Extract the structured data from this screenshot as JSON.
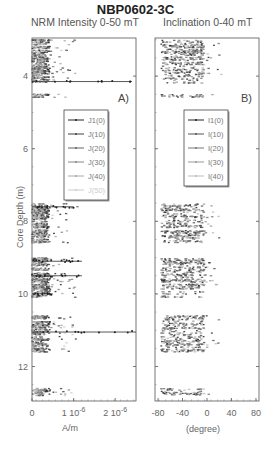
{
  "title": "NBP0602-3C",
  "panels": {
    "a": {
      "subtitle": "NRM Intensity  0-50 mT",
      "label": "A)",
      "xunit": "A/m"
    },
    "b": {
      "subtitle": "Inclination 0-40 mT",
      "label": "B)",
      "xunit": "(degree)"
    }
  },
  "ylabel": "Core Depth (m)",
  "chart_data": [
    {
      "type": "scatter",
      "title": "NRM Intensity 0-50 mT",
      "panel_label": "A)",
      "xlabel": "A/m",
      "ylabel": "Core Depth (m)",
      "xlim": [
        0,
        2.5e-06
      ],
      "ylim": [
        12.95,
        2.95
      ],
      "xticks": [
        0,
        1e-06,
        2e-06
      ],
      "xtick_labels": [
        "0",
        "1 10^-6",
        "2 10^-6"
      ],
      "yticks": [
        4,
        6,
        8,
        10,
        12
      ],
      "legend": [
        "J1(0)",
        "J(10)",
        "J(20)",
        "J(30)",
        "J(40)",
        "J(50)"
      ],
      "legend_position": "center-left inside",
      "grid": false,
      "depth_intervals_with_data": [
        [
          3.0,
          4.2
        ],
        [
          4.5,
          4.6
        ],
        [
          7.5,
          8.6
        ],
        [
          9.0,
          10.1
        ],
        [
          10.6,
          11.6
        ],
        [
          12.6,
          12.8
        ]
      ],
      "notable_spikes": [
        {
          "depth": 4.15,
          "x": 2.4e-06
        },
        {
          "depth": 7.6,
          "x": 1e-06
        },
        {
          "depth": 9.1,
          "x": 1.2e-06
        },
        {
          "depth": 9.5,
          "x": 1.2e-06
        },
        {
          "depth": 10.0,
          "x": 5e-07
        },
        {
          "depth": 11.05,
          "x": 2.5e-06
        }
      ],
      "series": [
        {
          "name": "J1(0)",
          "color": "#222222"
        },
        {
          "name": "J(10)",
          "color": "#444444"
        },
        {
          "name": "J(20)",
          "color": "#666666"
        },
        {
          "name": "J(30)",
          "color": "#888888"
        },
        {
          "name": "J(40)",
          "color": "#aaaaaa"
        },
        {
          "name": "J(50)",
          "color": "#cccccc"
        }
      ]
    },
    {
      "type": "scatter",
      "title": "Inclination 0-40 mT",
      "panel_label": "B)",
      "xlabel": "(degree)",
      "ylabel": "Core Depth (m)",
      "xlim": [
        -85,
        85
      ],
      "ylim": [
        12.95,
        2.95
      ],
      "xticks": [
        -80,
        -40,
        0,
        40,
        80
      ],
      "xtick_labels": [
        "-80",
        "-40",
        "0",
        "40",
        "80"
      ],
      "yticks": [
        4,
        6,
        8,
        10,
        12
      ],
      "legend": [
        "I1(0)",
        "I(10)",
        "I(20)",
        "I(30)",
        "I(40)"
      ],
      "legend_position": "center-right inside",
      "grid": false,
      "depth_intervals_with_data": [
        [
          3.0,
          4.2
        ],
        [
          4.5,
          4.6
        ],
        [
          7.5,
          8.6
        ],
        [
          9.0,
          10.1
        ],
        [
          10.6,
          11.6
        ],
        [
          12.6,
          12.8
        ]
      ],
      "typical_range_deg": [
        -80,
        20
      ],
      "series": [
        {
          "name": "I1(0)",
          "color": "#222222"
        },
        {
          "name": "I(10)",
          "color": "#555555"
        },
        {
          "name": "I(20)",
          "color": "#777777"
        },
        {
          "name": "I(30)",
          "color": "#999999"
        },
        {
          "name": "I(40)",
          "color": "#bbbbbb"
        }
      ]
    }
  ]
}
